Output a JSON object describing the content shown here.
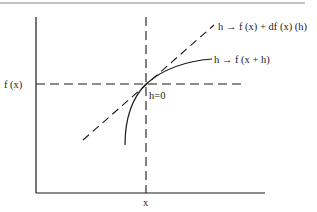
{
  "diagram": {
    "type": "derivative-tangent-line",
    "colors": {
      "ink": "#1a1a1a",
      "rule": "#8a8a8a",
      "background": "#ffffff"
    },
    "labels": {
      "y_tick": "f (x)",
      "x_tick": "x",
      "point_annotation": "h=0",
      "tangent_label": "h → f (x) + df (x) (h)",
      "curve_label": "h → f (x + h)"
    },
    "elements": {
      "axes": [
        "y-axis (solid vertical)",
        "x-axis (solid horizontal)"
      ],
      "guides": [
        "vertical dashed line at x",
        "horizontal dashed line at f(x)"
      ],
      "tangent": "dashed straight line through (x, f(x))",
      "curve": "solid concave curve through (x, f(x))"
    }
  }
}
